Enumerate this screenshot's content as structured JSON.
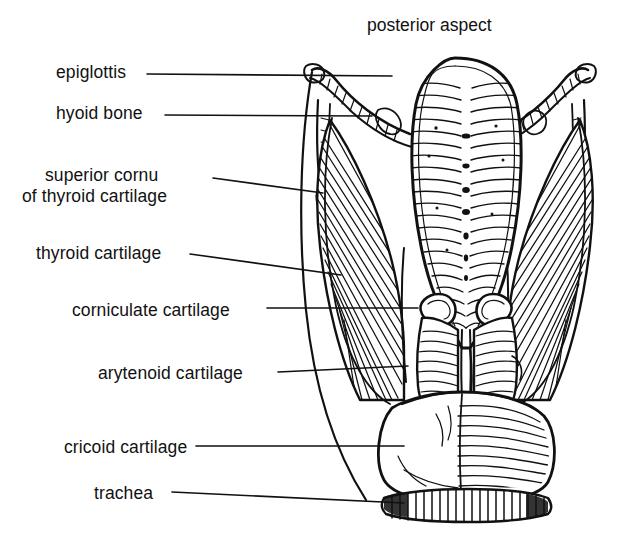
{
  "figure": {
    "title": "posterior aspect",
    "title_pos": {
      "x": 367,
      "y": 24
    },
    "view": "posterior aspect",
    "style": "black-and-white line engraving with hatching",
    "background_color": "#ffffff",
    "ink_color": "#111111"
  },
  "labels": [
    {
      "id": "epiglottis",
      "text": "epiglottis",
      "line1": "epiglottis",
      "line2": "",
      "text_x": 56,
      "text_y": 62,
      "leader": {
        "x1": 147,
        "y1": 74,
        "x2": 392,
        "y2": 76
      }
    },
    {
      "id": "hyoid-bone",
      "text": "hyoid bone",
      "line1": "hyoid bone",
      "line2": "",
      "text_x": 56,
      "text_y": 103,
      "leader": {
        "x1": 165,
        "y1": 115,
        "x2": 372,
        "y2": 116
      }
    },
    {
      "id": "superior-cornu-of-thyroid-cartilage",
      "text": "superior cornu of thyroid cartilage",
      "line1": "superior cornu",
      "line2": "of thyroid cartilage",
      "text_x": 45,
      "text_x2": 22,
      "text_y": 165,
      "leader": {
        "x1": 213,
        "y1": 178,
        "x2": 323,
        "y2": 193
      }
    },
    {
      "id": "thyroid-cartilage",
      "text": "thyroid cartilage",
      "line1": "thyroid cartilage",
      "line2": "",
      "text_x": 36,
      "text_y": 243,
      "leader": {
        "x1": 190,
        "y1": 254,
        "x2": 341,
        "y2": 275
      }
    },
    {
      "id": "corniculate-cartilage",
      "text": "corniculate cartilage",
      "line1": "corniculate cartilage",
      "line2": "",
      "text_x": 72,
      "text_y": 300,
      "leader": {
        "x1": 267,
        "y1": 308,
        "x2": 418,
        "y2": 308
      }
    },
    {
      "id": "arytenoid-cartilage",
      "text": "arytenoid cartilage",
      "line1": "arytenoid cartilage",
      "line2": "",
      "text_x": 98,
      "text_y": 363,
      "leader": {
        "x1": 278,
        "y1": 372,
        "x2": 408,
        "y2": 366
      }
    },
    {
      "id": "cricoid-cartilage",
      "text": "cricoid cartilage",
      "line1": "cricoid cartilage",
      "line2": "",
      "text_x": 64,
      "text_y": 437,
      "leader": {
        "x1": 196,
        "y1": 446,
        "x2": 404,
        "y2": 446
      }
    },
    {
      "id": "trachea",
      "text": "trachea",
      "line1": "trachea",
      "line2": "",
      "text_x": 94,
      "text_y": 483,
      "leader": {
        "x1": 172,
        "y1": 492,
        "x2": 404,
        "y2": 503
      }
    }
  ],
  "structures": [
    {
      "id": "epiglottis",
      "name": "epiglottis",
      "description": "central leaf-shaped plate with horizontal hatching and midline pits"
    },
    {
      "id": "hyoid-bone",
      "name": "hyoid bone",
      "description": "paired greater horns sweeping outward at top"
    },
    {
      "id": "superior-cornu",
      "name": "superior cornu of thyroid cartilage",
      "description": "slender upward horn on each side"
    },
    {
      "id": "thyroid-cartilage",
      "name": "thyroid cartilage",
      "description": "broad hatched lamina on each side"
    },
    {
      "id": "corniculate-cartilage",
      "name": "corniculate cartilage",
      "description": "small paired nodules above arytenoids"
    },
    {
      "id": "arytenoid-cartilage",
      "name": "arytenoid cartilage",
      "description": "paired pyramidal cartilages in midline"
    },
    {
      "id": "cricoid-cartilage",
      "name": "cricoid cartilage",
      "description": "broad signet-ring plate at base"
    },
    {
      "id": "trachea",
      "name": "trachea",
      "description": "fringed band at the lower margin"
    }
  ]
}
